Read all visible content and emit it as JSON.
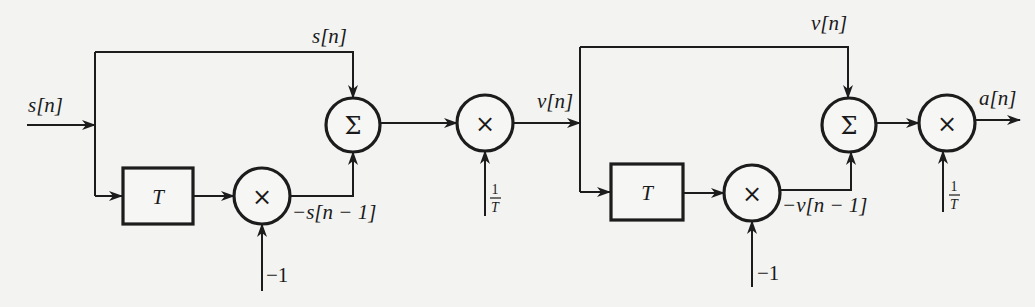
{
  "diagram": {
    "type": "block-diagram",
    "input": {
      "label": "s[n]"
    },
    "stages": [
      {
        "name": "stage-1",
        "top_branch_label": "s[n]",
        "delay_block": {
          "label": "T"
        },
        "negate_multiplier": {
          "symbol": "×",
          "gain_label": "−1"
        },
        "feedback_label": "−s[n − 1]",
        "summer": {
          "symbol": "Σ"
        },
        "scale_multiplier": {
          "symbol": "×",
          "gain_num": "1",
          "gain_den": "T"
        },
        "output_label": "v[n]"
      },
      {
        "name": "stage-2",
        "top_branch_label": "v[n]",
        "delay_block": {
          "label": "T"
        },
        "negate_multiplier": {
          "symbol": "×",
          "gain_label": "−1"
        },
        "feedback_label": "−v[n − 1]",
        "summer": {
          "symbol": "Σ"
        },
        "scale_multiplier": {
          "symbol": "×",
          "gain_num": "1",
          "gain_den": "T"
        },
        "output_label": "a[n]"
      }
    ]
  }
}
